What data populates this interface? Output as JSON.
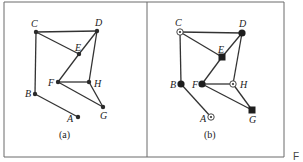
{
  "figure": {
    "panels": [
      {
        "id": "a",
        "caption": "(a)",
        "nodes": [
          {
            "id": "A",
            "label": "A",
            "marker": "dot"
          },
          {
            "id": "B",
            "label": "B",
            "marker": "dot"
          },
          {
            "id": "C",
            "label": "C",
            "marker": "dot"
          },
          {
            "id": "D",
            "label": "D",
            "marker": "dot"
          },
          {
            "id": "E",
            "label": "E",
            "marker": "dot"
          },
          {
            "id": "F",
            "label": "F",
            "marker": "dot"
          },
          {
            "id": "G",
            "label": "G",
            "marker": "dot"
          },
          {
            "id": "H",
            "label": "H",
            "marker": "dot"
          }
        ],
        "edges": [
          [
            "C",
            "D"
          ],
          [
            "C",
            "B"
          ],
          [
            "C",
            "E"
          ],
          [
            "D",
            "E"
          ],
          [
            "E",
            "F"
          ],
          [
            "D",
            "H"
          ],
          [
            "F",
            "H"
          ],
          [
            "F",
            "G"
          ],
          [
            "H",
            "G"
          ],
          [
            "B",
            "A"
          ]
        ]
      },
      {
        "id": "b",
        "caption": "(b)",
        "nodes": [
          {
            "id": "A",
            "label": "A",
            "marker": "ring"
          },
          {
            "id": "B",
            "label": "B",
            "marker": "filled-circle"
          },
          {
            "id": "C",
            "label": "C",
            "marker": "ring"
          },
          {
            "id": "D",
            "label": "D",
            "marker": "filled-circle"
          },
          {
            "id": "E",
            "label": "E",
            "marker": "filled-square"
          },
          {
            "id": "F",
            "label": "F",
            "marker": "filled-circle"
          },
          {
            "id": "G",
            "label": "G",
            "marker": "filled-square"
          },
          {
            "id": "H",
            "label": "H",
            "marker": "ring"
          }
        ],
        "edges": [
          [
            "C",
            "D"
          ],
          [
            "C",
            "B"
          ],
          [
            "C",
            "E"
          ],
          [
            "D",
            "E"
          ],
          [
            "E",
            "F"
          ],
          [
            "D",
            "H"
          ],
          [
            "F",
            "H"
          ],
          [
            "F",
            "G"
          ],
          [
            "H",
            "G"
          ],
          [
            "B",
            "A"
          ]
        ]
      }
    ],
    "stray_text": "F"
  }
}
